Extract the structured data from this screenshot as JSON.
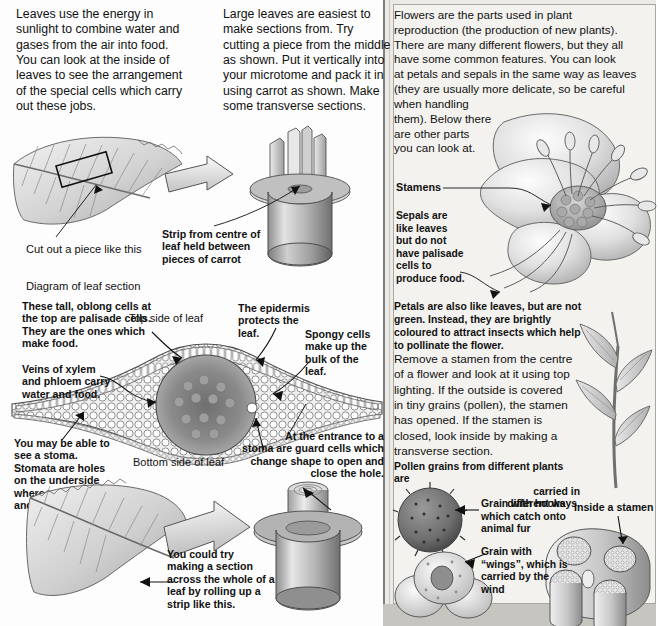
{
  "page": {
    "domain_description": "Scanned biology textbook page about examining leaves and flowers under a microscope",
    "background_color": "#fdfdfd",
    "panel_color": "#f3f2ef"
  },
  "left_column": {
    "intro_paragraph": "Leaves use the energy in sunlight to combine water and gases from the air into food. You can look at the inside of leaves to see the arrangement of the special cells which carry out these jobs.",
    "intro_lines": [
      "Leaves use the energy in",
      "sunlight to combine water and",
      "gases from the air into food.",
      "You can look at the inside of",
      "leaves to see the arrangement",
      "of the special cells which carry",
      "out these jobs."
    ],
    "captions": {
      "cut_piece": "Cut out a piece like this",
      "diagram_title": "Diagram of leaf section",
      "palisade": "These tall, oblong cells at the top are palisade cells. They are the ones which make food.",
      "palisade_lines": [
        "These tall, oblong cells at",
        "the top are palisade cells.",
        "They are the ones which",
        "make food."
      ],
      "veins": "Veins of xylem and phloem carry water and food.",
      "veins_lines": [
        "Veins of xylem",
        "and phloem carry",
        "water and food."
      ],
      "stoma": "You may be able to see a stoma. Stomata are holes on the underside where gases enter and leave.",
      "stoma_lines": [
        "You may be able to",
        "see a stoma.",
        "Stomata are holes",
        "on the underside",
        "where gases enter",
        "and leave."
      ],
      "bottom_side": "Bottom side of leaf",
      "top_side": "Top side of leaf",
      "rolling": "You could try making a section across the whole of a leaf by rolling up a strip like this.",
      "rolling_lines": [
        "You could try",
        "making a section",
        "across the whole of a",
        "leaf by rolling up a",
        "strip like this."
      ]
    }
  },
  "middle_column": {
    "intro_paragraph": "Large leaves are easiest to make sections from. Try cutting a piece from the middle as shown. Put it vertically into your microtome and pack it in using carrot as shown. Make some transverse sections.",
    "intro_lines": [
      "Large leaves are easiest to",
      "make sections from. Try",
      "cutting a piece from the middle",
      "as shown. Put it vertically into",
      "your microtome and pack it in",
      "using carrot as shown. Make",
      "some transverse sections."
    ],
    "captions": {
      "strip_carrot": "Strip from centre of leaf held between pieces of carrot",
      "strip_carrot_lines": [
        "Strip from centre of",
        "leaf held between",
        "pieces of carrot"
      ],
      "epidermis": "The epidermis protects the leaf.",
      "epidermis_lines": [
        "The epidermis",
        "protects the",
        "leaf."
      ],
      "spongy": "Spongy cells make up the bulk of the leaf.",
      "spongy_lines": [
        "Spongy cells",
        "make up the",
        "bulk of the",
        "leaf."
      ],
      "guard_cells": "At the entrance to a stoma are guard cells which change shape to open and close the hole.",
      "guard_cells_lines": [
        "At the entrance to a",
        "stoma are guard cells which",
        "change shape to open and",
        "close the hole."
      ]
    }
  },
  "right_panel": {
    "intro_paragraph": "Flowers are the parts used in plant reproduction (the production of new plants). There are many different flowers, but they all have some common features. You can look at petals and sepals in the same way as leaves (they are usually more delicate, so be careful when handling them). Below there are other parts you can look at.",
    "intro_lines": [
      "Flowers are the parts used in plant",
      "reproduction (the production of new plants).",
      "There are many different flowers, but they all",
      "have some common features. You can look",
      "at petals and sepals in the same way as leaves",
      "(they are usually more delicate, so be careful",
      "when handling",
      "them). Below there",
      "are other parts",
      "you can look at."
    ],
    "labels": {
      "stamens": "Stamens",
      "sepals": "Sepals are like leaves but do not have palisade cells to produce food.",
      "sepals_lines": [
        "Sepals are",
        "like leaves",
        "but do not",
        "have palisade",
        "cells to",
        "produce food."
      ],
      "petals": "Petals are also like leaves, but are not green. Instead, they are brightly coloured to attract insects which help to pollinate the flower.",
      "petals_lines": [
        "Petals are also like leaves, but are not",
        "green. Instead, they are brightly",
        "coloured to attract insects which help",
        "to pollinate the flower."
      ],
      "remove_stamen": "Remove a stamen from the centre of a flower and look at it using top lighting. If the outside is covered in tiny grains (pollen), the stamen has opened. If the stamen is closed, look inside by making a transverse section.",
      "remove_stamen_lines": [
        "Remove a stamen from the centre",
        "of a flower and look at it using top",
        "lighting. If the outside is covered",
        "in tiny grains (pollen), the stamen",
        "has opened. If the stamen is",
        "closed, look inside by making a",
        "transverse section."
      ],
      "pollen_intro": "Pollen grains from different plants are carried in different ways.",
      "pollen_intro_lines": [
        "Pollen grains from different plants are",
        "carried in",
        "different ways."
      ],
      "hooks": "Grain with hooks which catch onto animal fur",
      "hooks_lines": [
        "Grain with hooks",
        "which catch onto",
        "animal fur"
      ],
      "wings": "Grain with “wings”, which is carried by the wind",
      "wings_lines": [
        "Grain with",
        "“wings”, which is",
        "carried by the",
        "wind"
      ],
      "inside_stamen": "Inside a stamen"
    }
  }
}
